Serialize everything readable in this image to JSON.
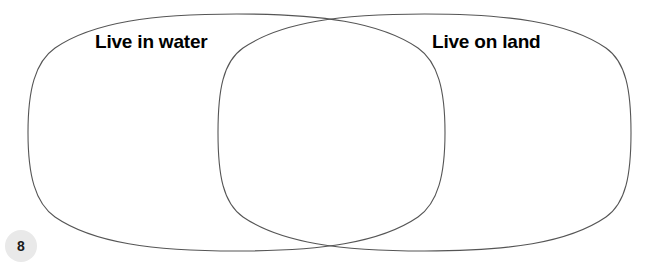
{
  "worksheet": {
    "page_number": "8",
    "background_color": "#ffffff",
    "stroke_color": "#555555",
    "stroke_width": 1,
    "badge_color": "#e9e9e9",
    "label_color": "#000000"
  },
  "diagram": {
    "type": "venn",
    "set_count": 2,
    "left_set": {
      "label": "Live in water",
      "fill": "none"
    },
    "right_set": {
      "label": "Live on land",
      "fill": "none"
    },
    "intersection": {
      "label": "",
      "items": []
    },
    "left_items": [],
    "right_items": []
  }
}
